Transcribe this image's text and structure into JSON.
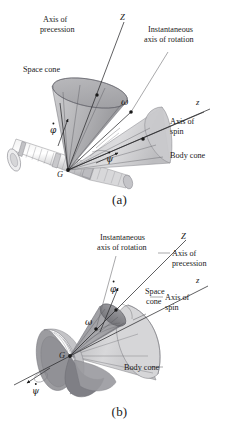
{
  "figure": {
    "panels": [
      {
        "id": "a",
        "caption": "(a)",
        "labels": {
          "axis_of_precession": "Axis of\nprecession",
          "axis_of_precession_line1": "Axis of",
          "axis_of_precession_line2": "precession",
          "instantaneous_axis_line1": "Instantaneous",
          "instantaneous_axis_line2": "axis of rotation",
          "space_cone": "Space cone",
          "body_cone": "Body cone",
          "axis_of_spin_line1": "Axis of",
          "axis_of_spin_line2": "spin",
          "Z_axis": "Z",
          "z_axis": "z",
          "omega": "ω",
          "phi_dot": "φ",
          "psi_dot": "ψ",
          "center_point": "G"
        }
      },
      {
        "id": "b",
        "caption": "(b)",
        "labels": {
          "instantaneous_axis_line1": "Instantaneous",
          "instantaneous_axis_line2": "axis of rotation",
          "axis_of_precession_line1": "Axis of",
          "axis_of_precession_line2": "precession",
          "space_cone_line1": "Space",
          "space_cone_line2": "cone",
          "axis_of_spin_line1": "Axis of",
          "axis_of_spin_line2": "spin",
          "body_cone": "Body cone",
          "Z_axis": "Z",
          "z_axis": "z",
          "omega": "ω",
          "phi_dot": "φ",
          "psi_dot": "ψ",
          "center_point": "G"
        }
      }
    ]
  },
  "colors": {
    "background": "#ffffff",
    "ink": "#1a1a1a",
    "leader": "#6e6e72",
    "space_cone_fill": "#b8b8bb",
    "space_cone_dark": "#9a9a9e",
    "body_cone_fill": "#d2d2d4",
    "body_cone_dark": "#b0b0b3",
    "rotor_fill": "#e2e2e3",
    "rotor_shadow": "#a9a9ad",
    "disc_dark": "#8d8d91",
    "axis_line": "#2b2b2e"
  }
}
